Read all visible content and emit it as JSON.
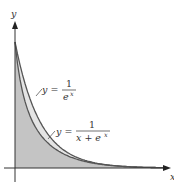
{
  "chart_data": {
    "type": "area",
    "title": "",
    "xlabel": "x",
    "ylabel": "y",
    "series": [
      {
        "name": "y = 1/e^x",
        "formula": "1/e^x",
        "fill": "light gray (region between curves)"
      },
      {
        "name": "y = 1/(x + e^x)",
        "formula": "1/(x+e^x)",
        "fill": "darker gray (region under curve)"
      }
    ],
    "annotations": [
      {
        "text_lhs": "y =",
        "numerator": "1",
        "denominator": "e^x"
      },
      {
        "text_lhs": "y =",
        "numerator": "1",
        "denominator": "x + e^x"
      }
    ],
    "grid": false,
    "xlim": [
      0,
      5.8
    ],
    "ylim": [
      0,
      1.15
    ]
  },
  "labels": {
    "x_axis": "x",
    "y_axis": "y",
    "curve1": {
      "lhs": "y =",
      "num": "1",
      "den": "e",
      "den_exp": "x"
    },
    "curve2": {
      "lhs": "y =",
      "num": "1",
      "den": "x + e",
      "den_exp": "x"
    }
  },
  "colors": {
    "outer_fill": "#e4e4e4",
    "inner_fill": "#c4c4c4",
    "curve": "#555555",
    "axis": "#333333"
  }
}
